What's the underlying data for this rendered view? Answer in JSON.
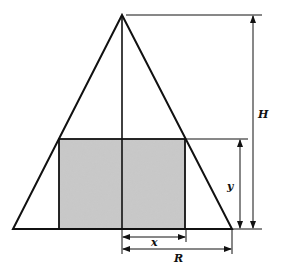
{
  "diagram": {
    "colors": {
      "stroke": "#111111",
      "shade": "#c8c8c8",
      "background": "#ffffff"
    },
    "labels": {
      "height": "H",
      "cylinder_height": "y",
      "cylinder_radius": "x",
      "cone_radius": "R"
    }
  }
}
